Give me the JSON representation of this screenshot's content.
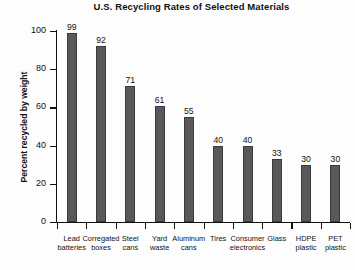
{
  "chart_data": {
    "type": "bar",
    "title": "U.S. Recycling Rates of Selected Materials",
    "xlabel": "",
    "ylabel": "Percent recycled by weight",
    "ylim": [
      0,
      100
    ],
    "yticks": [
      0,
      20,
      40,
      60,
      80,
      100
    ],
    "grid": false,
    "legend": null,
    "bar_color": "#59595b",
    "background_color": "#fdfdfd",
    "categories": [
      "Lead batteries",
      "Corregated boxes",
      "Steel cans",
      "Yard waste",
      "Aluminum cans",
      "Tires",
      "Consumer electronics",
      "Glass",
      "HDPE plastic",
      "PET plastic"
    ],
    "category_lines": [
      [
        "Lead",
        "batteries"
      ],
      [
        "Corregated",
        "boxes"
      ],
      [
        "Steel",
        "cans"
      ],
      [
        "Yard",
        "waste"
      ],
      [
        "Aluminum",
        "cans"
      ],
      [
        "Tires",
        ""
      ],
      [
        "Consumer",
        "electronics"
      ],
      [
        "Glass",
        ""
      ],
      [
        "HDPE",
        "plastic"
      ],
      [
        "PET",
        "plastic"
      ]
    ],
    "values": [
      99,
      92,
      71,
      61,
      55,
      40,
      40,
      33,
      30,
      30
    ],
    "value_labels": [
      "99",
      "92",
      "71",
      "61",
      "55",
      "40",
      "40",
      "33",
      "30",
      "30"
    ],
    "ytick_labels": [
      "0",
      "20",
      "40",
      "60",
      "80",
      "100"
    ]
  }
}
